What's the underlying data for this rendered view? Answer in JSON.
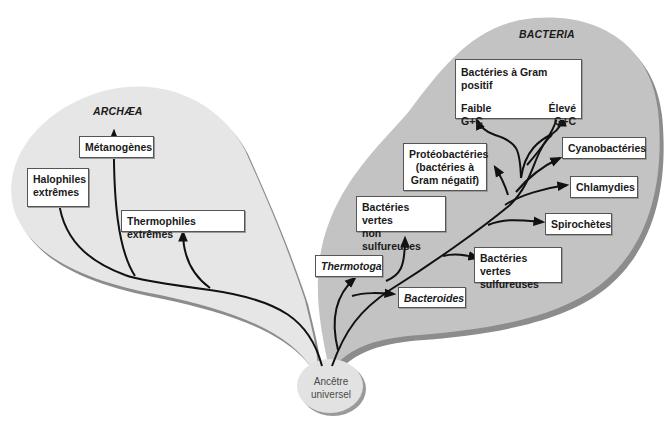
{
  "diagram": {
    "type": "phylogenetic-tree",
    "colors": {
      "archaea_fill": "#e6e6e6",
      "bacteria_fill": "#c3c3c3",
      "shadow": "#8c8c8c",
      "ancestor_fill": "#e2e2e2",
      "line": "#111111",
      "box_border": "#555555"
    },
    "root": {
      "label_line1": "Ancêtre",
      "label_line2": "universel"
    },
    "domains": {
      "archaea": {
        "title": "ARCHÆA",
        "groups": [
          {
            "line1": "Halophiles",
            "line2": "extrêmes"
          },
          {
            "line1": "Métanogènes"
          },
          {
            "line1": "Thermophiles extrêmes"
          }
        ]
      },
      "bacteria": {
        "title": "BACTERIA",
        "gram_positive": {
          "title": "Bactéries à Gram positif",
          "left_top": "Faible",
          "left_bottom": "G+C",
          "right_top": "Élevé",
          "right_bottom": "G+C"
        },
        "groups": [
          {
            "line1": "Protéobactéries",
            "line2": "(bactéries à",
            "line3": "Gram négatif)"
          },
          {
            "line1": "Cyanobactéries"
          },
          {
            "line1": "Chlamydies"
          },
          {
            "line1": "Spirochètes"
          },
          {
            "line1": "Bactéries vertes",
            "line2": "non sulfureuses"
          },
          {
            "line1": "Bactéries vertes",
            "line2": "sulfureuses"
          },
          {
            "line1": "Thermotoga"
          },
          {
            "line1": "Bacteroides"
          }
        ]
      }
    }
  }
}
